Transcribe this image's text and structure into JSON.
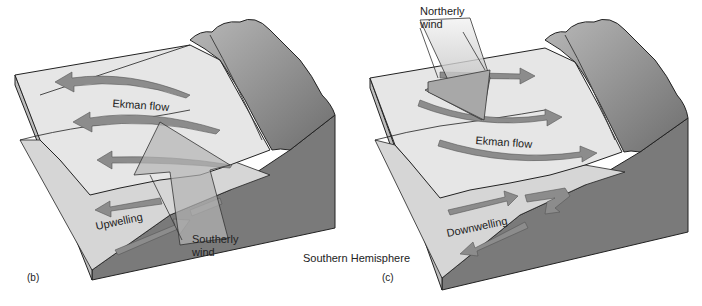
{
  "figure": {
    "hemisphere_label": "Southern Hemisphere",
    "caption_fragment": "",
    "panels": [
      {
        "id": "b",
        "panel_label": "(b)",
        "wind_label_line1": "Southerly",
        "wind_label_line2": "wind",
        "flow_label": "Ekman flow",
        "vertical_label": "Upwelling",
        "flow_direction": "offshore",
        "vertical_direction": "up"
      },
      {
        "id": "c",
        "panel_label": "(c)",
        "wind_label_line1": "Northerly",
        "wind_label_line2": "wind",
        "flow_label": "Ekman flow",
        "vertical_label": "Downwelling",
        "flow_direction": "onshore",
        "vertical_direction": "down"
      }
    ],
    "colors": {
      "water_surface": "#e4e4e4",
      "water_side": "#d2d2d2",
      "seabed": "#7a7a7a",
      "coast": "#9a9a9a",
      "arrow": "#8c8c8c",
      "wind_arrow": "#b4b4b4",
      "outline": "#222222"
    }
  }
}
